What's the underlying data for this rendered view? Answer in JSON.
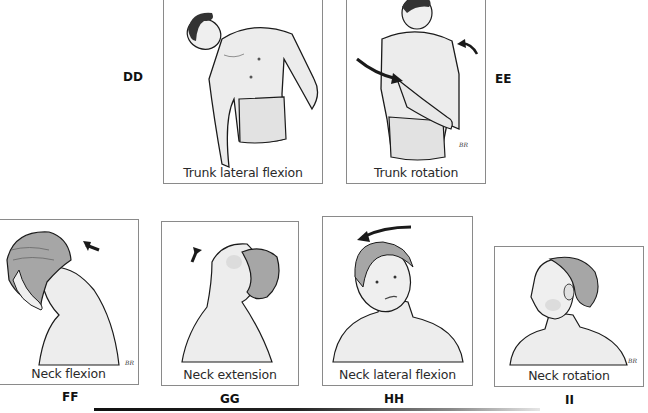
{
  "figure": {
    "panels": [
      {
        "id": "DD",
        "label": "DD",
        "caption": "Trunk lateral flexion"
      },
      {
        "id": "EE",
        "label": "EE",
        "caption": "Trunk rotation"
      },
      {
        "id": "FF",
        "label": "FF",
        "caption": "Neck flexion"
      },
      {
        "id": "GG",
        "label": "GG",
        "caption": "Neck extension"
      },
      {
        "id": "HH",
        "label": "HH",
        "caption": "Neck lateral flexion"
      },
      {
        "id": "II",
        "label": "II",
        "caption": "Neck rotation"
      }
    ],
    "artist_initials": "BR",
    "colors": {
      "frame": "#8a8a8a",
      "skin": "#ededed",
      "hair": "#9a9a9a",
      "ink": "#1a1a1a"
    }
  }
}
